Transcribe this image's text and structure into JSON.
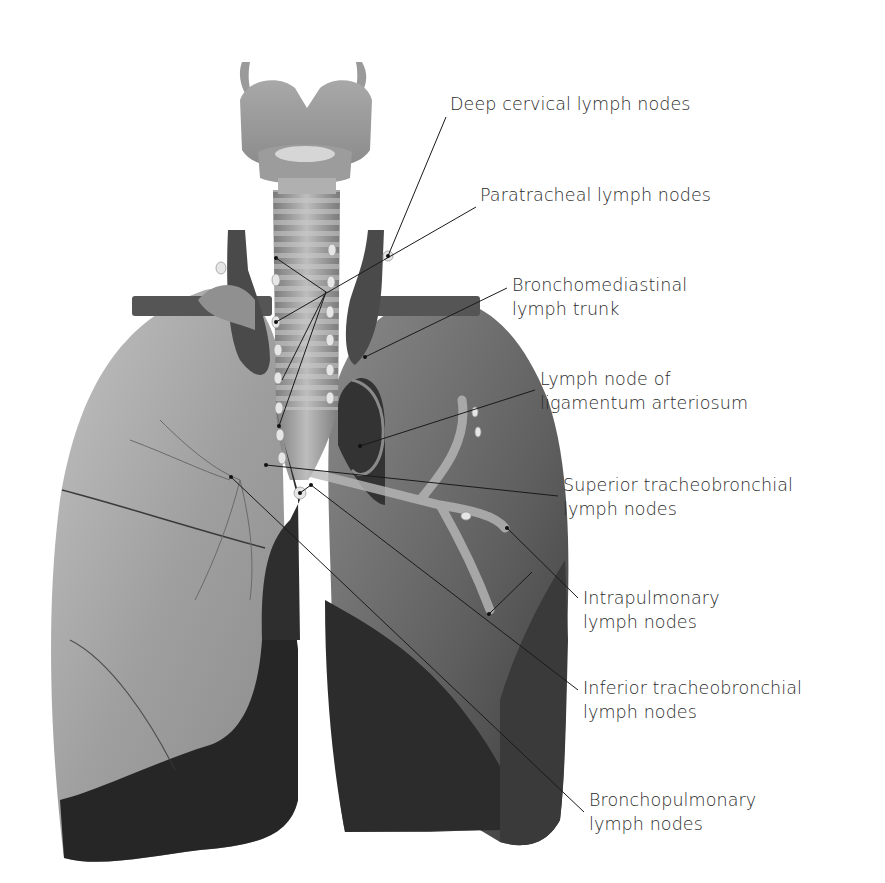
{
  "diagram": {
    "colors": {
      "background": "#ffffff",
      "label_text": "#2b2b2b",
      "leader_line": "#1a1a1a",
      "right_lung": "#a9a9a9",
      "left_lung": "#6e6e6e",
      "lung_shadow": "#262626",
      "trachea": "#9a9a9a",
      "vessels": "#4a4a4a",
      "lymph_node": "#e6e6e6"
    },
    "labels": [
      {
        "id": "deep-cervical",
        "lines": [
          "Deep cervical lymph nodes"
        ],
        "x": 450,
        "y": 92,
        "target": [
          388,
          256
        ]
      },
      {
        "id": "paratracheal",
        "lines": [
          "Paratracheal lymph nodes"
        ],
        "x": 480,
        "y": 183,
        "target": [
          276,
          322
        ]
      },
      {
        "id": "bronchomediastinal",
        "lines": [
          "Bronchomediastinal",
          "lymph trunk"
        ],
        "x": 512,
        "y": 273,
        "target": [
          365,
          357
        ]
      },
      {
        "id": "ligamentum-arteriosum",
        "lines": [
          "Lymph node of",
          "ligamentum arteriosum"
        ],
        "x": 540,
        "y": 367,
        "target": [
          360,
          446
        ]
      },
      {
        "id": "superior-tracheobronchial",
        "lines": [
          "Superior tracheobronchial",
          "lymph nodes"
        ],
        "x": 563,
        "y": 473,
        "target": [
          266,
          465
        ]
      },
      {
        "id": "intrapulmonary",
        "lines": [
          "Intrapulmonary",
          "lymph nodes"
        ],
        "x": 583,
        "y": 586,
        "target": [
          507,
          528
        ]
      },
      {
        "id": "inferior-tracheobronchial",
        "lines": [
          "Inferior tracheobronchial",
          "lymph nodes"
        ],
        "x": 583,
        "y": 676,
        "target": [
          311,
          485
        ]
      },
      {
        "id": "bronchopulmonary",
        "lines": [
          "Bronchopulmonary",
          "lymph nodes"
        ],
        "x": 589,
        "y": 788,
        "target": [
          231,
          477
        ]
      }
    ]
  }
}
